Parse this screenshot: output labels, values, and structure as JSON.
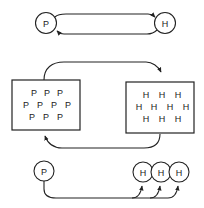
{
  "colors": {
    "stroke": "#222222",
    "background": "#ffffff"
  },
  "panel_top": {
    "description": "One-to-one two-way interaction",
    "left_node": {
      "label": "P"
    },
    "right_node": {
      "label": "H"
    }
  },
  "panel_middle": {
    "description": "Group-to-group two-way interaction",
    "left_box": {
      "rows": [
        [
          "P",
          "P",
          "P"
        ],
        [
          "P",
          "P",
          "P",
          "P"
        ],
        [
          "P",
          "P",
          "P"
        ]
      ]
    },
    "right_box": {
      "rows": [
        [
          "H",
          "H",
          "H"
        ],
        [
          "H",
          "H",
          "H",
          "H"
        ],
        [
          "H",
          "H",
          "H"
        ]
      ]
    }
  },
  "panel_bottom": {
    "description": "One-to-many one-way interaction",
    "source_node": {
      "label": "P"
    },
    "target_nodes": [
      {
        "label": "H"
      },
      {
        "label": "H"
      },
      {
        "label": "H"
      }
    ]
  }
}
